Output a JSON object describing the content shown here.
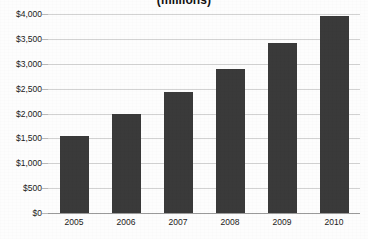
{
  "chart_data": {
    "type": "bar",
    "title": "(millions)",
    "xlabel": "",
    "ylabel": "",
    "categories": [
      "2005",
      "2006",
      "2007",
      "2008",
      "2009",
      "2010"
    ],
    "values": [
      1540,
      1990,
      2430,
      2890,
      3420,
      3970
    ],
    "ylim": [
      0,
      4000
    ],
    "ytick_values": [
      0,
      500,
      1000,
      1500,
      2000,
      2500,
      3000,
      3500,
      4000
    ],
    "ytick_labels": [
      "$0",
      "$500",
      "$1,000",
      "$1,500",
      "$2,000",
      "$2,500",
      "$3,000",
      "$3,500",
      "$4,000"
    ],
    "grid": true,
    "legend": false,
    "legend_position": "none",
    "series": [
      {
        "name": "",
        "values": [
          1540,
          1990,
          2430,
          2890,
          3420,
          3970
        ]
      }
    ],
    "colors": {
      "bar": "#3a3a3a",
      "gridline": "#d2d2d2",
      "axis": "#9a9a9a",
      "text": "#1a1a1a",
      "background": "#fdfdfd"
    }
  }
}
